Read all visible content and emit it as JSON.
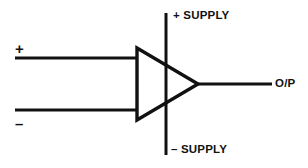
{
  "diagram": {
    "type": "circuit-schematic",
    "stroke_color": "#111111",
    "background_color": "#ffffff",
    "line_width": 3,
    "component": {
      "name": "operational-amplifier",
      "shape": "triangle",
      "filled": false,
      "vertices": [
        [
          137,
          48
        ],
        [
          137,
          120
        ],
        [
          198,
          84
        ]
      ]
    },
    "terminals": {
      "noninverting_input": {
        "label": "+",
        "icon": "plus-sign",
        "line": {
          "x1": 15,
          "y1": 58,
          "x2": 138,
          "y2": 58
        }
      },
      "inverting_input": {
        "label": "–",
        "icon": "minus-sign",
        "line": {
          "x1": 15,
          "y1": 110,
          "x2": 138,
          "y2": 110
        }
      },
      "positive_supply": {
        "label": "+ SUPPLY",
        "line": {
          "x1": 166,
          "y1": 13,
          "x2": 166,
          "y2": 84
        }
      },
      "negative_supply": {
        "label": "– SUPPLY",
        "line": {
          "x1": 166,
          "y1": 84,
          "x2": 166,
          "y2": 155
        }
      },
      "output": {
        "label": "O/P",
        "line": {
          "x1": 197,
          "y1": 84,
          "x2": 272,
          "y2": 84
        }
      }
    }
  }
}
